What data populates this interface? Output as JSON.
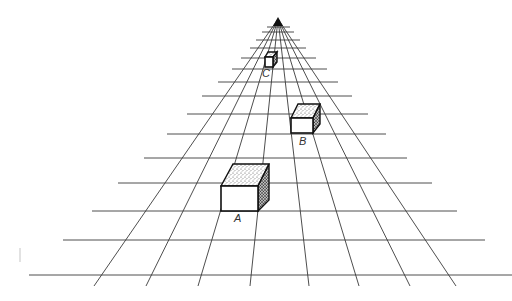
{
  "figure": {
    "vanishing_point": {
      "x": 278,
      "y": 19
    },
    "colors": {
      "line": "#3a3a3a",
      "cube_outline": "#111111",
      "background": "#ffffff"
    },
    "grid": {
      "converging_line_bottoms_x": [
        94,
        146,
        198,
        250,
        309,
        359,
        410,
        456
      ],
      "converging_line_bottom_y": 286,
      "horizontals": [
        {
          "y": 27,
          "x1": 267,
          "x2": 290
        },
        {
          "y": 32,
          "x1": 262,
          "x2": 294
        },
        {
          "y": 40,
          "x1": 256,
          "x2": 300
        },
        {
          "y": 48,
          "x1": 250,
          "x2": 306
        },
        {
          "y": 58,
          "x1": 241,
          "x2": 316
        },
        {
          "y": 69,
          "x1": 232,
          "x2": 327
        },
        {
          "y": 82,
          "x1": 218,
          "x2": 338
        },
        {
          "y": 96,
          "x1": 202,
          "x2": 352
        },
        {
          "y": 114,
          "x1": 187,
          "x2": 368
        },
        {
          "y": 134,
          "x1": 167,
          "x2": 386
        },
        {
          "y": 158,
          "x1": 144,
          "x2": 407
        },
        {
          "y": 183,
          "x1": 118,
          "x2": 432
        },
        {
          "y": 211,
          "x1": 92,
          "x2": 457
        },
        {
          "y": 240,
          "x1": 63,
          "x2": 485
        },
        {
          "y": 275,
          "x1": 29,
          "x2": 512
        }
      ]
    },
    "cubes": [
      {
        "label": "A",
        "label_pos": {
          "x": 234,
          "y": 213
        }
      },
      {
        "label": "B",
        "label_pos": {
          "x": 299,
          "y": 136
        }
      },
      {
        "label": "C",
        "label_pos": {
          "x": 262,
          "y": 68
        }
      }
    ]
  }
}
